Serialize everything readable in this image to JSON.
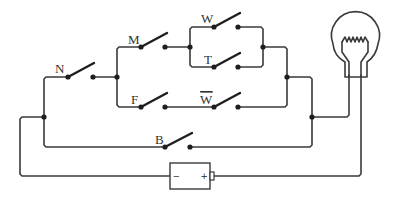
{
  "diagram": {
    "type": "electrical circuit",
    "switches": [
      {
        "id": "N",
        "label": "N"
      },
      {
        "id": "M",
        "label": "M"
      },
      {
        "id": "W",
        "label": "W"
      },
      {
        "id": "T",
        "label": "T"
      },
      {
        "id": "F",
        "label": "F"
      },
      {
        "id": "W_bar",
        "label": "W",
        "overline": true
      },
      {
        "id": "B",
        "label": "B"
      }
    ],
    "battery": {
      "negative": "−",
      "positive": "+"
    },
    "lamp": {
      "label": ""
    },
    "colors": {
      "wire": "#3a3a3a",
      "background": "#ffffff"
    }
  }
}
